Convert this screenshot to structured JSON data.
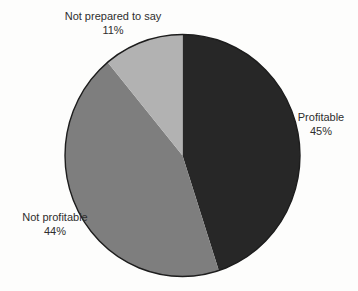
{
  "chart_data": {
    "type": "pie",
    "title": "",
    "unit": "%",
    "total": 100,
    "direction": "clockwise",
    "start_angle_deg": 0,
    "legend_position": "labels-outside",
    "outline_color": "#1d1d1d",
    "background_color": "#fdfdfc",
    "slices": [
      {
        "label": "Profitable",
        "value": 45,
        "display": "45%",
        "color": "#272727"
      },
      {
        "label": "Not profitable",
        "value": 44,
        "display": "44%",
        "color": "#7e7e7e"
      },
      {
        "label": "Not prepared to say",
        "value": 11,
        "display": "11%",
        "color": "#b2b2b2"
      }
    ]
  }
}
